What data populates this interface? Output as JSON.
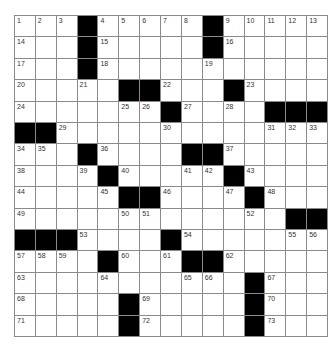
{
  "puzzle": {
    "rows": 15,
    "cols": 15,
    "colors": {
      "block": "#000000",
      "cell": "#ffffff",
      "grid_line": "#8a8a8a",
      "number": "#333333"
    },
    "layout": [
      "...#.....#.....",
      "...#.....#.....",
      "...#...........",
      ".....##...#....",
      ".......#....###",
      "##.............",
      "...#....##.....",
      "....#.....#....",
      ".....##....#...",
      ".............##",
      "###....#.......",
      "....#...##.....",
      "...........#...",
      ".....#.....#...",
      ".....#.....#..."
    ],
    "numbers": [
      {
        "r": 0,
        "c": 0,
        "n": "1"
      },
      {
        "r": 0,
        "c": 1,
        "n": "2"
      },
      {
        "r": 0,
        "c": 2,
        "n": "3"
      },
      {
        "r": 0,
        "c": 4,
        "n": "4"
      },
      {
        "r": 0,
        "c": 5,
        "n": "5"
      },
      {
        "r": 0,
        "c": 6,
        "n": "6"
      },
      {
        "r": 0,
        "c": 7,
        "n": "7"
      },
      {
        "r": 0,
        "c": 8,
        "n": "8"
      },
      {
        "r": 0,
        "c": 10,
        "n": "9"
      },
      {
        "r": 0,
        "c": 11,
        "n": "10"
      },
      {
        "r": 0,
        "c": 12,
        "n": "11"
      },
      {
        "r": 0,
        "c": 13,
        "n": "12"
      },
      {
        "r": 0,
        "c": 14,
        "n": "13"
      },
      {
        "r": 1,
        "c": 0,
        "n": "14"
      },
      {
        "r": 1,
        "c": 4,
        "n": "15"
      },
      {
        "r": 1,
        "c": 10,
        "n": "16"
      },
      {
        "r": 2,
        "c": 0,
        "n": "17"
      },
      {
        "r": 2,
        "c": 4,
        "n": "18"
      },
      {
        "r": 2,
        "c": 9,
        "n": "19"
      },
      {
        "r": 3,
        "c": 0,
        "n": "20"
      },
      {
        "r": 3,
        "c": 3,
        "n": "21"
      },
      {
        "r": 3,
        "c": 7,
        "n": "22"
      },
      {
        "r": 3,
        "c": 11,
        "n": "23"
      },
      {
        "r": 4,
        "c": 0,
        "n": "24"
      },
      {
        "r": 4,
        "c": 5,
        "n": "25"
      },
      {
        "r": 4,
        "c": 6,
        "n": "26"
      },
      {
        "r": 4,
        "c": 8,
        "n": "27"
      },
      {
        "r": 4,
        "c": 10,
        "n": "28"
      },
      {
        "r": 5,
        "c": 2,
        "n": "29"
      },
      {
        "r": 5,
        "c": 7,
        "n": "30"
      },
      {
        "r": 5,
        "c": 12,
        "n": "31"
      },
      {
        "r": 5,
        "c": 13,
        "n": "32"
      },
      {
        "r": 5,
        "c": 14,
        "n": "33"
      },
      {
        "r": 6,
        "c": 0,
        "n": "34"
      },
      {
        "r": 6,
        "c": 1,
        "n": "35"
      },
      {
        "r": 6,
        "c": 4,
        "n": "36"
      },
      {
        "r": 6,
        "c": 10,
        "n": "37"
      },
      {
        "r": 7,
        "c": 0,
        "n": "38"
      },
      {
        "r": 7,
        "c": 3,
        "n": "39"
      },
      {
        "r": 7,
        "c": 5,
        "n": "40"
      },
      {
        "r": 7,
        "c": 8,
        "n": "41"
      },
      {
        "r": 7,
        "c": 9,
        "n": "42"
      },
      {
        "r": 7,
        "c": 11,
        "n": "43"
      },
      {
        "r": 8,
        "c": 0,
        "n": "44"
      },
      {
        "r": 8,
        "c": 4,
        "n": "45"
      },
      {
        "r": 8,
        "c": 7,
        "n": "46"
      },
      {
        "r": 8,
        "c": 10,
        "n": "47"
      },
      {
        "r": 8,
        "c": 12,
        "n": "48"
      },
      {
        "r": 9,
        "c": 0,
        "n": "49"
      },
      {
        "r": 9,
        "c": 5,
        "n": "50"
      },
      {
        "r": 9,
        "c": 6,
        "n": "51"
      },
      {
        "r": 9,
        "c": 11,
        "n": "52"
      },
      {
        "r": 10,
        "c": 3,
        "n": "53"
      },
      {
        "r": 10,
        "c": 8,
        "n": "54"
      },
      {
        "r": 10,
        "c": 13,
        "n": "55"
      },
      {
        "r": 10,
        "c": 14,
        "n": "56"
      },
      {
        "r": 11,
        "c": 0,
        "n": "57"
      },
      {
        "r": 11,
        "c": 1,
        "n": "58"
      },
      {
        "r": 11,
        "c": 2,
        "n": "59"
      },
      {
        "r": 11,
        "c": 5,
        "n": "60"
      },
      {
        "r": 11,
        "c": 7,
        "n": "61"
      },
      {
        "r": 11,
        "c": 10,
        "n": "62"
      },
      {
        "r": 12,
        "c": 0,
        "n": "63"
      },
      {
        "r": 12,
        "c": 4,
        "n": "64"
      },
      {
        "r": 12,
        "c": 8,
        "n": "65"
      },
      {
        "r": 12,
        "c": 9,
        "n": "66"
      },
      {
        "r": 12,
        "c": 12,
        "n": "67"
      },
      {
        "r": 13,
        "c": 0,
        "n": "68"
      },
      {
        "r": 13,
        "c": 6,
        "n": "69"
      },
      {
        "r": 13,
        "c": 12,
        "n": "70"
      },
      {
        "r": 14,
        "c": 0,
        "n": "71"
      },
      {
        "r": 14,
        "c": 6,
        "n": "72"
      },
      {
        "r": 14,
        "c": 12,
        "n": "73"
      }
    ]
  }
}
